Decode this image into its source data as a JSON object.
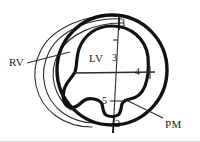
{
  "figure": {
    "type": "anatomical-diagram",
    "background_color": "#ffffff",
    "stroke_color": "#111111",
    "thin_stroke_color": "#333333"
  },
  "labels": {
    "rv": "RV",
    "lv": "LV",
    "pm": "PM"
  },
  "markers": {
    "one": "1",
    "two": "2",
    "three": "3",
    "four": "4",
    "five": "5"
  }
}
